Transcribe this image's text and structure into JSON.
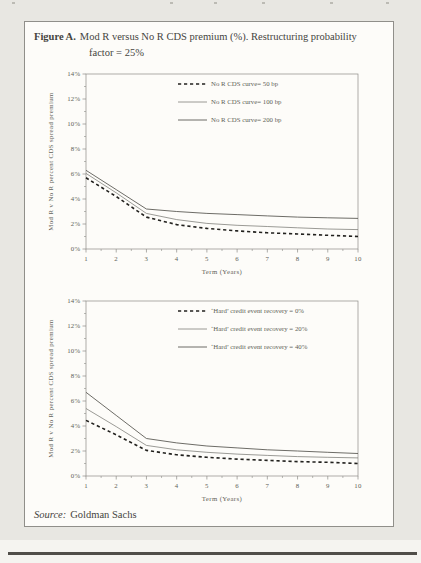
{
  "figure": {
    "label": "Figure A.",
    "title_rest": "Mod R versus No R CDS premium (%). Restructuring probability",
    "title_line2": "factor = 25%"
  },
  "source": {
    "label": "Source:",
    "text": "Goldman Sachs"
  },
  "colors": {
    "page_background": "#e8e7e2",
    "panel_background": "#fdfcf9",
    "panel_border": "#908f8a",
    "text": "#45443e",
    "chart_text": "#615f58",
    "dashed_series": "#22211e",
    "thin_series": "#7a7974",
    "solid_series": "#5c5b56",
    "bottom_rule": "#504e49"
  },
  "chart_data": [
    {
      "type": "line",
      "x": [
        1,
        2,
        3,
        4,
        5,
        6,
        7,
        8,
        9,
        10
      ],
      "xlabel": "Term (Years)",
      "ylabel": "Mod R v No R percent CDS spread premium",
      "ylim": [
        0,
        14
      ],
      "ytick_step": 2,
      "ytick_suffix": "%",
      "grid": false,
      "legend_position": "top-right-inside",
      "series": [
        {
          "name": "No R CDS curve= 50 bp",
          "style": "dashed",
          "values": [
            5.7,
            4.2,
            2.55,
            1.95,
            1.65,
            1.45,
            1.3,
            1.2,
            1.1,
            1.0
          ]
        },
        {
          "name": "No R CDS curve= 100 bp",
          "style": "solid-thin",
          "values": [
            6.05,
            4.5,
            2.85,
            2.35,
            2.05,
            1.9,
            1.8,
            1.7,
            1.6,
            1.55
          ]
        },
        {
          "name": "No R CDS curve= 200 bp",
          "style": "solid",
          "values": [
            6.3,
            4.75,
            3.2,
            3.0,
            2.85,
            2.75,
            2.65,
            2.55,
            2.5,
            2.45
          ]
        }
      ]
    },
    {
      "type": "line",
      "x": [
        1,
        2,
        3,
        4,
        5,
        6,
        7,
        8,
        9,
        10
      ],
      "xlabel": "Term (Years)",
      "ylabel": "Mod R v No R percent CDS spread premium",
      "ylim": [
        0,
        14
      ],
      "ytick_step": 2,
      "ytick_suffix": "%",
      "grid": false,
      "legend_position": "top-right-inside",
      "series": [
        {
          "name": "‘Hard’ credit event recovery = 0%",
          "style": "dashed",
          "values": [
            4.45,
            3.3,
            2.05,
            1.7,
            1.5,
            1.35,
            1.25,
            1.15,
            1.1,
            1.0
          ]
        },
        {
          "name": "‘Hard’ credit event recovery = 20%",
          "style": "solid-thin",
          "values": [
            5.4,
            3.95,
            2.45,
            2.1,
            1.9,
            1.75,
            1.65,
            1.55,
            1.5,
            1.45
          ]
        },
        {
          "name": "‘Hard’ credit event recovery = 40%",
          "style": "solid",
          "values": [
            6.7,
            4.85,
            3.0,
            2.65,
            2.4,
            2.25,
            2.1,
            2.0,
            1.9,
            1.8
          ]
        }
      ]
    }
  ]
}
